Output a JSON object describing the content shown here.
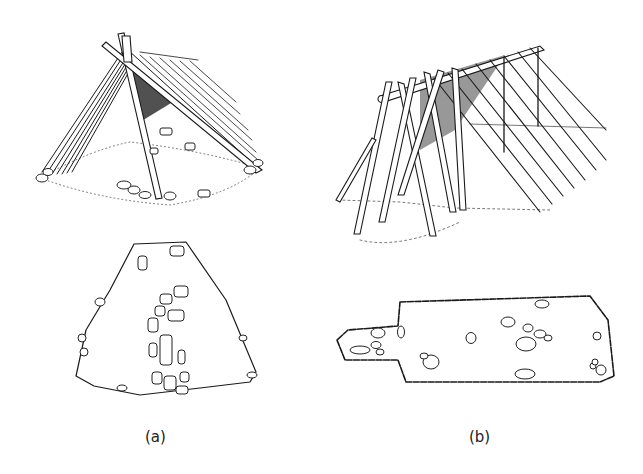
{
  "figure": {
    "panels": [
      {
        "id": "a",
        "label": "(a)",
        "elevation": "A-frame lean-to shelter of leaning poles with crossed apex, stone footing",
        "plan": "Trapezoidal floor plan outlined with stones, central stone cluster"
      },
      {
        "id": "b",
        "label": "(b)",
        "elevation": "Elongated ridge-pole tent frame supported by crossed bipod poles and vertical posts",
        "plan": "Rectangular floor plan with narrow entrance extension on the left, scattered stones"
      }
    ],
    "colors": {
      "ink": "#1a1a1a",
      "background": "#ffffff"
    }
  }
}
